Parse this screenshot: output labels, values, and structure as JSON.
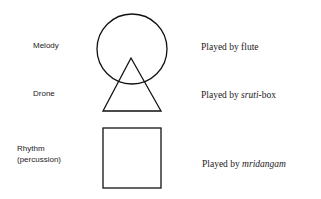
{
  "diagram": {
    "rows": [
      {
        "role": "Melody",
        "shape": "circle",
        "instrument_prefix": "Played by ",
        "instrument": "flute",
        "instrument_suffix": ""
      },
      {
        "role": "Drone",
        "shape": "triangle",
        "instrument_prefix": "Played by ",
        "instrument": "sruti",
        "instrument_suffix": "-box"
      },
      {
        "role": "Rhythm",
        "role_sub": "(percussion)",
        "shape": "square",
        "instrument_prefix": "Played by ",
        "instrument": "mridangam",
        "instrument_suffix": ""
      }
    ],
    "stroke_color": "#111111"
  }
}
